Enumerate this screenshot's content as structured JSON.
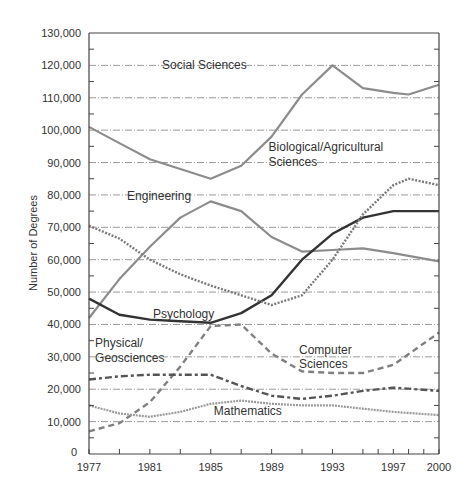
{
  "chart_data": {
    "type": "line",
    "title": "",
    "xlabel": "",
    "ylabel": "Number of Degrees",
    "ylim": [
      0,
      130000
    ],
    "xlim": [
      1977,
      2000
    ],
    "grid": true,
    "legend_position": "inline labels",
    "x_ticks": [
      1977,
      1981,
      1985,
      1989,
      1993,
      1997,
      2000
    ],
    "y_ticks": [
      "0",
      "10,000",
      "20,000",
      "30,000",
      "40,000",
      "50,000",
      "60,000",
      "70,000",
      "80,000",
      "90,000",
      "100,000",
      "110,000",
      "120,000",
      "130,000"
    ],
    "series": [
      {
        "name": "Social Sciences",
        "style": "solid-gray",
        "color": "#8c8c8c",
        "x": [
          1977,
          1979,
          1981,
          1983,
          1985,
          1987,
          1989,
          1991,
          1993,
          1995,
          1997,
          1998,
          2000
        ],
        "values": [
          101000,
          96000,
          91000,
          88000,
          85000,
          89000,
          98000,
          111000,
          120000,
          113000,
          111500,
          111000,
          114000
        ]
      },
      {
        "name": "Engineering",
        "style": "solid-gray",
        "color": "#8c8c8c",
        "x": [
          1977,
          1979,
          1981,
          1983,
          1985,
          1987,
          1989,
          1991,
          1993,
          1995,
          1997,
          2000
        ],
        "values": [
          42000,
          54000,
          64000,
          73000,
          78000,
          75000,
          67000,
          62500,
          63000,
          63500,
          62000,
          59500
        ]
      },
      {
        "name": "Psychology",
        "style": "solid-dark",
        "color": "#333333",
        "x": [
          1977,
          1979,
          1981,
          1983,
          1985,
          1987,
          1989,
          1991,
          1993,
          1995,
          1997,
          2000
        ],
        "values": [
          48000,
          43000,
          41500,
          41000,
          40500,
          43500,
          49000,
          60000,
          68000,
          73000,
          75000,
          75000
        ]
      },
      {
        "name": "Biological/Agricultural Sciences",
        "style": "dotted",
        "color": "#7a7a7a",
        "x": [
          1977,
          1979,
          1981,
          1983,
          1985,
          1987,
          1989,
          1991,
          1993,
          1995,
          1997,
          1998,
          2000
        ],
        "values": [
          70500,
          66500,
          60000,
          55500,
          52000,
          49000,
          46000,
          49000,
          60000,
          74000,
          83000,
          85000,
          83000
        ]
      },
      {
        "name": "Computer Sciences",
        "style": "dashed",
        "color": "#808080",
        "x": [
          1977,
          1979,
          1981,
          1983,
          1985,
          1987,
          1989,
          1991,
          1993,
          1995,
          1997,
          2000
        ],
        "values": [
          7000,
          9500,
          16000,
          27000,
          39500,
          40000,
          31000,
          25500,
          25000,
          25000,
          27500,
          37500
        ]
      },
      {
        "name": "Physical/Geosciences",
        "style": "dash-dot",
        "color": "#555555",
        "x": [
          1977,
          1979,
          1981,
          1983,
          1985,
          1987,
          1989,
          1991,
          1993,
          1995,
          1997,
          2000
        ],
        "values": [
          23000,
          24000,
          24500,
          24500,
          24500,
          21000,
          18000,
          17000,
          18000,
          19500,
          20500,
          19500
        ]
      },
      {
        "name": "Mathematics",
        "style": "dotted-gray",
        "color": "#9a9a9a",
        "x": [
          1977,
          1979,
          1981,
          1983,
          1985,
          1987,
          1989,
          1991,
          1993,
          1995,
          1997,
          2000
        ],
        "values": [
          15000,
          12500,
          11500,
          13000,
          15500,
          16500,
          15500,
          15000,
          15000,
          14000,
          13000,
          12000
        ]
      }
    ],
    "annotations": [
      {
        "text": "Social Sciences",
        "x": 1981.8,
        "y": 119000
      },
      {
        "text": "Biological/Agricultural",
        "x": 1988.8,
        "y": 93500
      },
      {
        "text": "Sciences",
        "x": 1988.8,
        "y": 89000
      },
      {
        "text": "Engineering",
        "x": 1979.5,
        "y": 78500
      },
      {
        "text": "Psychology",
        "x": 1981.2,
        "y": 42000
      },
      {
        "text": "Physical/",
        "x": 1977.4,
        "y": 33000
      },
      {
        "text": "Geosciences",
        "x": 1977.4,
        "y": 28500
      },
      {
        "text": "Computer",
        "x": 1990.8,
        "y": 31000
      },
      {
        "text": "Sciences",
        "x": 1990.8,
        "y": 26500
      },
      {
        "text": "Mathematics",
        "x": 1985.2,
        "y": 12000
      }
    ]
  }
}
